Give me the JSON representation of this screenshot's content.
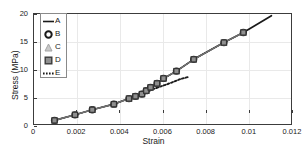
{
  "chart_data": {
    "type": "line",
    "title": "",
    "xlabel": "Strain",
    "ylabel": "Stress (MPa)",
    "xlim": [
      0,
      0.012
    ],
    "ylim": [
      0,
      20
    ],
    "xticks": [
      "0",
      "0.002",
      "0.004",
      "0.006",
      "0.008",
      "0.01",
      "0.012"
    ],
    "xtick_values": [
      0,
      0.002,
      0.004,
      0.006,
      0.008,
      0.01,
      0.012
    ],
    "yticks": [
      "0",
      "5",
      "10",
      "15",
      "20"
    ],
    "ytick_values": [
      0,
      5,
      10,
      15,
      20
    ],
    "grid": true,
    "legend_position": "upper left",
    "legend_entries": [
      {
        "label": "A",
        "marker": "none",
        "linestyle": "solid",
        "color": "#1a1a1a"
      },
      {
        "label": "B",
        "marker": "circle",
        "linestyle": "none",
        "color": "#1a1a1a"
      },
      {
        "label": "C",
        "marker": "triangle",
        "linestyle": "none",
        "color": "#9a9a9a"
      },
      {
        "label": "D",
        "marker": "square",
        "linestyle": "none",
        "color": "#7d7d7d"
      },
      {
        "label": "E",
        "marker": "none",
        "linestyle": "dotted",
        "color": "#1a1a1a"
      }
    ],
    "series": [
      {
        "name": "A",
        "marker": "none",
        "linestyle": "solid",
        "x": [
          0.00095,
          0.0019,
          0.0027,
          0.0037,
          0.0044,
          0.0047,
          0.005,
          0.0052,
          0.0054,
          0.0057,
          0.006,
          0.0066,
          0.0074,
          0.0088,
          0.0097,
          0.011
        ],
        "y": [
          1.0,
          2.0,
          2.9,
          3.9,
          4.9,
          5.3,
          5.7,
          6.3,
          6.9,
          7.6,
          8.5,
          9.8,
          11.9,
          14.9,
          16.7,
          19.7
        ]
      },
      {
        "name": "B",
        "marker": "circle",
        "linestyle": "solid",
        "x": [
          0.00095,
          0.0019,
          0.0027,
          0.0037,
          0.0044,
          0.0047,
          0.005,
          0.0052,
          0.0054,
          0.0057,
          0.006,
          0.0066,
          0.0074,
          0.0088,
          0.0097
        ],
        "y": [
          1.0,
          2.0,
          2.9,
          3.9,
          4.9,
          5.3,
          5.7,
          6.3,
          6.9,
          7.6,
          8.5,
          9.8,
          11.9,
          14.9,
          16.7
        ]
      },
      {
        "name": "C",
        "marker": "triangle",
        "linestyle": "solid",
        "x": [
          0.00095,
          0.0019,
          0.0027,
          0.0037,
          0.0044,
          0.0047,
          0.005,
          0.0052,
          0.0054,
          0.0057,
          0.006,
          0.0066,
          0.0074,
          0.0088,
          0.0097
        ],
        "y": [
          1.0,
          2.0,
          2.9,
          3.9,
          4.9,
          5.3,
          5.7,
          6.3,
          6.9,
          7.6,
          8.5,
          9.8,
          11.9,
          14.9,
          16.7
        ]
      },
      {
        "name": "D",
        "marker": "square",
        "linestyle": "solid",
        "x": [
          0.00095,
          0.0019,
          0.0027,
          0.0037,
          0.0044,
          0.0047,
          0.005,
          0.0052,
          0.0054,
          0.0057,
          0.006,
          0.0066,
          0.0074,
          0.0088,
          0.0097
        ],
        "y": [
          1.0,
          2.0,
          2.9,
          3.9,
          4.9,
          5.3,
          5.7,
          6.3,
          6.9,
          7.6,
          8.5,
          9.8,
          11.9,
          14.9,
          16.7
        ]
      },
      {
        "name": "E",
        "marker": "none",
        "linestyle": "dotted",
        "x": [
          0.005,
          0.0056,
          0.0062,
          0.0068,
          0.0072
        ],
        "y": [
          5.7,
          6.7,
          7.5,
          8.4,
          8.8
        ]
      }
    ]
  },
  "colors": {
    "axis": "#3c3c3c",
    "grid": "#e9e9e9",
    "line_a": "#1a1a1a",
    "marker_fill": "#8f8f8f",
    "marker_edge": "#2a2a2a",
    "background": "#ffffff"
  }
}
